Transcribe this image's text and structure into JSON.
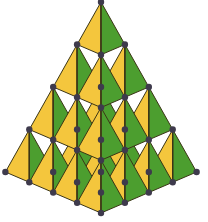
{
  "diagram": {
    "levels": 4,
    "apex": [
      101,
      2
    ],
    "vector_left": [
      -23.9,
      42.5
    ],
    "vector_right": [
      23.9,
      42.5
    ],
    "vector_front": [
      0,
      52.75
    ],
    "colors": {
      "left_face": "#F4C63D",
      "right_face": "#4C9E2F",
      "edge": "#3B3516",
      "vertex": "#3E3A4C",
      "background": "#FFFFFF"
    },
    "vertex_radius": 3.2
  }
}
